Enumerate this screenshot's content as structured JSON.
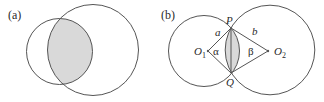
{
  "panels": [
    {
      "label": "(a)",
      "description": "Two overlapping circles with shaded lens-shaped intersection",
      "circles": [
        {
          "cx": 59.5,
          "cy": 51.5,
          "r": 33
        },
        {
          "cx": 93,
          "cy": 50,
          "r": 45.5
        }
      ]
    },
    {
      "label": "(b)",
      "description": "Two intersecting circles with centers O1, O2 and intersection points P, Q",
      "points": {
        "P": "P",
        "Q": "Q",
        "O1": "O",
        "O1_sub": "1",
        "O2": "O",
        "O2_sub": "2"
      },
      "segments": {
        "a": "a",
        "b": "b"
      },
      "angles": {
        "alpha": "α",
        "beta": "β"
      }
    }
  ],
  "colors": {
    "stroke": "#555555",
    "shade": "#d9d9d9"
  }
}
